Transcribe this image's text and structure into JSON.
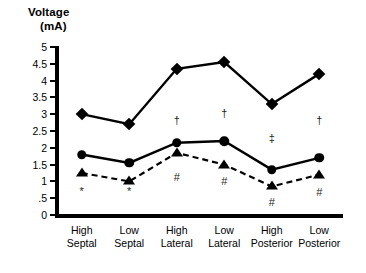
{
  "axis_title": {
    "line1": "Voltage",
    "line2": "(mA)"
  },
  "chart_data": {
    "type": "line",
    "title": "Voltage (mA)",
    "xlabel": "",
    "ylabel": "Voltage (mA)",
    "ylim": [
      0,
      5
    ],
    "ytick_labels": [
      "0",
      ".5",
      "1",
      "1.5",
      "2",
      "2.5",
      "3",
      "3.5",
      "4",
      "4.5",
      "5"
    ],
    "ytick_values": [
      0,
      0.5,
      1,
      1.5,
      2,
      2.5,
      3,
      3.5,
      4,
      4.5,
      5
    ],
    "grid": false,
    "legend": "none",
    "categories": [
      "High Septal",
      "Low Septal",
      "High Lateral",
      "Low Lateral",
      "High Posterior",
      "Low Posterior"
    ],
    "category_lines": [
      [
        "High",
        "Septal"
      ],
      [
        "Low",
        "Septal"
      ],
      [
        "High",
        "Lateral"
      ],
      [
        "Low",
        "Lateral"
      ],
      [
        "High",
        "Posterior"
      ],
      [
        "Low",
        "Posterior"
      ]
    ],
    "series": [
      {
        "name": "diamond-series",
        "marker": "diamond",
        "line_style": "solid",
        "values": [
          3.0,
          2.7,
          4.35,
          4.55,
          3.3,
          4.2
        ]
      },
      {
        "name": "circle-series",
        "marker": "circle",
        "line_style": "solid",
        "values": [
          1.8,
          1.55,
          2.15,
          2.2,
          1.35,
          1.7
        ]
      },
      {
        "name": "triangle-series",
        "marker": "triangle",
        "line_style": "dashed",
        "values": [
          1.25,
          1.0,
          1.85,
          1.5,
          0.85,
          1.2
        ]
      }
    ],
    "annotations": [
      {
        "symbol": "*",
        "category": "High Septal",
        "x_index": 0,
        "y": 0.72
      },
      {
        "symbol": "*",
        "category": "Low Septal",
        "x_index": 1,
        "y": 0.72
      },
      {
        "symbol": "#",
        "category": "High Lateral",
        "x_index": 2,
        "y": 1.13
      },
      {
        "symbol": "#",
        "category": "Low Lateral",
        "x_index": 3,
        "y": 1.02
      },
      {
        "symbol": "#",
        "category": "High Posterior",
        "x_index": 4,
        "y": 0.4
      },
      {
        "symbol": "#",
        "category": "Low Posterior",
        "x_index": 5,
        "y": 0.68
      },
      {
        "symbol": "†",
        "category": "High Lateral",
        "x_index": 2,
        "y": 2.82
      },
      {
        "symbol": "†",
        "category": "Low Lateral",
        "x_index": 3,
        "y": 3.05
      },
      {
        "symbol": "‡",
        "category": "High Posterior",
        "x_index": 4,
        "y": 2.28
      },
      {
        "symbol": "†",
        "category": "Low Posterior",
        "x_index": 5,
        "y": 2.82
      }
    ]
  },
  "colors": {
    "ink": "#000000",
    "annotation": "#231f20",
    "background": "#ffffff"
  }
}
